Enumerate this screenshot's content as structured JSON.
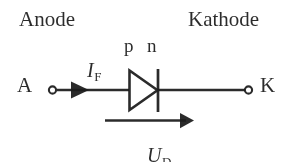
{
  "figure": {
    "background_color": "#ffffff",
    "ink_color": "#1c1c1c",
    "width": 293,
    "height": 162
  },
  "labels": {
    "anode_heading": "Anode",
    "kathode_heading": "Kathode",
    "anode_terminal": "A",
    "kathode_terminal": "K",
    "p_region": "p",
    "n_region": "n"
  },
  "quantities": {
    "forward_current": {
      "symbol": "I",
      "subscript": "F"
    },
    "diode_voltage": {
      "symbol": "U",
      "subscript": "D"
    }
  },
  "symbol": {
    "component": "diode",
    "triangle_fill": "none",
    "cathode_bar": "vertical-line",
    "terminals": [
      "open-circle",
      "open-circle"
    ],
    "current_arrow_direction": "left-to-right",
    "voltage_arrow_direction": "left-to-right"
  }
}
